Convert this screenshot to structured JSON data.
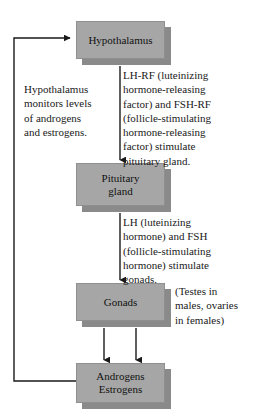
{
  "diagram": {
    "colors": {
      "box_fill": "#a6a6a6",
      "box_shadow": "#8a8a8a",
      "box_border": "#8f8f8f",
      "line": "#1a1a1a",
      "text": "#1a1a1a",
      "background": "#ffffff"
    },
    "nodes": [
      {
        "id": "hypothalamus",
        "label": "Hypothalamus"
      },
      {
        "id": "pituitary",
        "label": "Pituitary\ngland"
      },
      {
        "id": "gonads",
        "label": "Gonads"
      },
      {
        "id": "androgens",
        "label": "Androgens\nEstrogens"
      }
    ],
    "annotations": [
      {
        "id": "feedback",
        "text": "Hypothalamus\nmonitors levels\nof androgens\nand estrogens."
      },
      {
        "id": "lhrf",
        "text": "LH-RF (luteinizing\nhormone-releasing\nfactor) and FSH-RF\n(follicle-stimulating\nhormone-releasing\nfactor) stimulate\npituitary gland."
      },
      {
        "id": "lhfsh",
        "text": "LH (luteinizing\nhormone) and FSH\n(follicle-stimulating\nhormone) stimulate\ngonads."
      },
      {
        "id": "gonad-note",
        "text": "(Testes in\nmales, ovaries\nin females)"
      }
    ],
    "connectors": [
      {
        "id": "hypothalamus-to-pituitary",
        "from": "hypothalamus",
        "to": "pituitary",
        "direction": "down"
      },
      {
        "id": "pituitary-to-gonads",
        "from": "pituitary",
        "to": "gonads",
        "direction": "down"
      },
      {
        "id": "gonads-to-androgens-left",
        "from": "gonads",
        "to": "androgens",
        "direction": "down"
      },
      {
        "id": "gonads-to-androgens-right",
        "from": "gonads",
        "to": "androgens",
        "direction": "down"
      },
      {
        "id": "androgens-feedback-to-hypothalamus",
        "from": "androgens",
        "to": "hypothalamus",
        "direction": "feedback-left"
      }
    ]
  }
}
